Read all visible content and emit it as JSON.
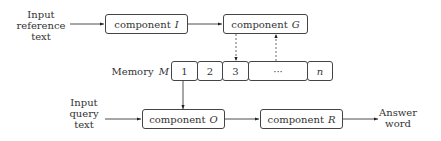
{
  "inputs": {
    "reference": [
      "Input",
      "reference",
      "text"
    ],
    "query": [
      "Input",
      "query",
      "text"
    ]
  },
  "output": [
    "Answer",
    "word"
  ],
  "components": {
    "I": {
      "label": "component",
      "symbol": "I"
    },
    "G": {
      "label": "component",
      "symbol": "G"
    },
    "O": {
      "label": "component",
      "symbol": "O"
    },
    "R": {
      "label": "component",
      "symbol": "R"
    }
  },
  "memory": {
    "label": "Memory",
    "symbol": "M",
    "cells": [
      "1",
      "2",
      "3",
      "···",
      "n"
    ]
  }
}
